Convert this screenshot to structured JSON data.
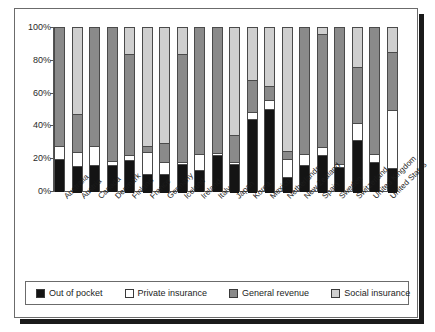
{
  "figure": {
    "title": "",
    "frame_color": "#6b6b6b"
  },
  "legend": {
    "position": "bottom",
    "items": [
      {
        "label": "Out of pocket",
        "color": "#141414",
        "key": "out_of_pocket"
      },
      {
        "label": "Private insurance",
        "color": "#ffffff",
        "key": "private_insurance"
      },
      {
        "label": "General revenue",
        "color": "#8a8a8a",
        "key": "general_revenue"
      },
      {
        "label": "Social insurance",
        "color": "#cfcfcf",
        "key": "social_insurance"
      }
    ]
  },
  "chart_data": {
    "type": "bar",
    "subtype": "stacked-100-percent",
    "title": "",
    "xlabel": "",
    "ylabel": "",
    "ylim": [
      0,
      100
    ],
    "yticks": [
      0,
      20,
      40,
      60,
      80,
      100
    ],
    "ytick_labels": [
      "0%",
      "20%",
      "40%",
      "60%",
      "80%",
      "100%"
    ],
    "grid": false,
    "legend_position": "bottom",
    "categories": [
      "Australia",
      "Austria",
      "Canada",
      "Denmark",
      "Finland",
      "France",
      "Germany",
      "Iceland",
      "Ireland",
      "Italy",
      "Japan",
      "Korea",
      "Mexico",
      "Netherlands",
      "New Zealand",
      "Spain",
      "Sweden",
      "Switzerland",
      "United Kingdom",
      "United States"
    ],
    "series": [
      {
        "name": "Out of pocket",
        "color": "#141414",
        "values": [
          20,
          16,
          16,
          16,
          20,
          11,
          11,
          17,
          13,
          22,
          17,
          45,
          51,
          9,
          16,
          23,
          15,
          32,
          18,
          15
        ]
      },
      {
        "name": "Private insurance",
        "color": "#ffffff",
        "values": [
          7,
          8,
          11,
          2,
          2,
          13,
          7,
          1,
          9,
          1,
          1,
          4,
          5,
          11,
          6,
          4,
          1,
          10,
          4,
          35
        ]
      },
      {
        "name": "General revenue",
        "color": "#8a8a8a",
        "values": [
          73,
          23,
          73,
          82,
          62,
          3,
          11,
          66,
          78,
          77,
          16,
          19,
          8,
          4,
          78,
          69,
          84,
          34,
          78,
          35
        ]
      },
      {
        "name": "Social insurance",
        "color": "#cfcfcf",
        "values": [
          0,
          53,
          0,
          0,
          16,
          73,
          71,
          16,
          0,
          0,
          66,
          32,
          36,
          76,
          0,
          4,
          0,
          24,
          0,
          15
        ]
      }
    ]
  }
}
